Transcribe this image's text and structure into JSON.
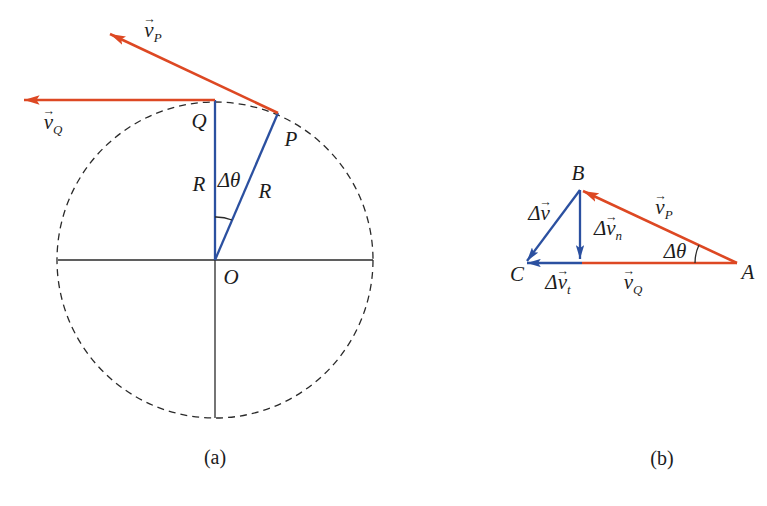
{
  "colors": {
    "vector_red": "#dd4823",
    "vector_blue": "#2b50a0",
    "line_black": "#2a2a2a"
  },
  "glyphs": {
    "vec_arrow": "→"
  },
  "fig_a": {
    "caption": "(a)",
    "labels": {
      "vp": {
        "prefix": "",
        "base": "v",
        "sub": "P"
      },
      "vq": {
        "prefix": "",
        "base": "v",
        "sub": "Q"
      },
      "Q": {
        "text": "Q"
      },
      "P": {
        "text": "P"
      },
      "R_left": {
        "text": "R"
      },
      "R_right": {
        "text": "R"
      },
      "delta_theta": {
        "text": "Δθ"
      },
      "O": {
        "text": "O"
      }
    }
  },
  "fig_b": {
    "caption": "(b)",
    "labels": {
      "B": {
        "text": "B"
      },
      "A": {
        "text": "A"
      },
      "C": {
        "text": "C"
      },
      "vp": {
        "prefix": "",
        "base": "v",
        "sub": "P"
      },
      "vq": {
        "prefix": "",
        "base": "v",
        "sub": "Q"
      },
      "dv": {
        "prefix": "Δ",
        "base": "v",
        "sub": ""
      },
      "dvn": {
        "prefix": "Δ",
        "base": "v",
        "sub": "n"
      },
      "dvt": {
        "prefix": "Δ",
        "base": "v",
        "sub": "t"
      },
      "delta_theta": {
        "text": "Δθ"
      }
    }
  }
}
